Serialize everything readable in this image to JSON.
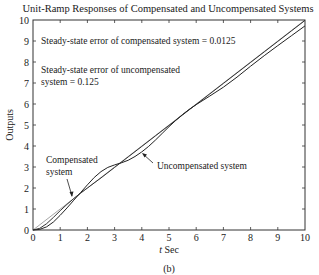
{
  "chart_data": {
    "type": "line",
    "title": "Unit-Ramp Responses of Compensated and Uncompensated Systems",
    "xlabel_italic": "t",
    "xlabel_rest": " Sec",
    "ylabel": "Outputs",
    "caption": "(b)",
    "xlim": [
      0,
      10
    ],
    "ylim": [
      0,
      10
    ],
    "xticks": [
      0,
      1,
      2,
      3,
      4,
      5,
      6,
      7,
      8,
      9,
      10
    ],
    "yticks": [
      0,
      1,
      2,
      3,
      4,
      5,
      6,
      7,
      8,
      9,
      10
    ],
    "grid": false,
    "series": [
      {
        "name": "Unit-ramp input",
        "color": "#9a9a9a",
        "x": [
          0,
          10
        ],
        "y": [
          0,
          10
        ]
      },
      {
        "name": "Compensated system",
        "color": "#333333",
        "x": [
          0,
          0.25,
          0.5,
          0.75,
          1,
          1.25,
          1.5,
          1.75,
          2,
          2.5,
          3,
          3.5,
          4,
          4.5,
          5,
          5.5,
          6,
          6.5,
          7,
          7.5,
          8,
          8.5,
          9,
          9.5,
          10
        ],
        "y": [
          0,
          0.08,
          0.3,
          0.6,
          0.92,
          1.22,
          1.5,
          1.76,
          2.0,
          2.48,
          2.98,
          3.48,
          3.98,
          4.48,
          4.98,
          5.48,
          5.98,
          6.48,
          6.98,
          7.48,
          7.98,
          8.48,
          8.98,
          9.48,
          9.98
        ]
      },
      {
        "name": "Uncompensated system",
        "color": "#222222",
        "x": [
          0,
          0.25,
          0.5,
          0.75,
          1,
          1.25,
          1.5,
          1.75,
          2,
          2.25,
          2.5,
          2.75,
          3,
          3.25,
          3.5,
          3.75,
          4,
          4.25,
          4.5,
          4.75,
          5,
          5.25,
          5.5,
          5.75,
          6,
          6.5,
          7,
          7.5,
          8,
          8.5,
          9,
          9.5,
          10
        ],
        "y": [
          0,
          0.03,
          0.15,
          0.38,
          0.7,
          1.05,
          1.42,
          1.78,
          2.15,
          2.5,
          2.78,
          2.98,
          3.1,
          3.2,
          3.32,
          3.5,
          3.72,
          3.98,
          4.28,
          4.6,
          4.92,
          5.22,
          5.5,
          5.75,
          5.97,
          6.38,
          6.8,
          7.28,
          7.8,
          8.3,
          8.78,
          9.25,
          9.72
        ]
      }
    ],
    "annotations": [
      {
        "id": "ss-comp",
        "text": "Steady-state error of compensated system = 0.0125"
      },
      {
        "id": "ss-uncomp-1",
        "text": "Steady-state error of uncompensated"
      },
      {
        "id": "ss-uncomp-2",
        "text": "system = 0.125"
      },
      {
        "id": "comp-label-1",
        "text": "Compensated"
      },
      {
        "id": "comp-label-2",
        "text": "system"
      },
      {
        "id": "uncomp-label",
        "text": "Uncompensated system"
      }
    ]
  }
}
